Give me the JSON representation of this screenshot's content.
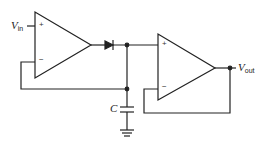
{
  "diagram": {
    "type": "circuit",
    "labels": {
      "vin_main": "V",
      "vin_sub": "in",
      "vout_main": "V",
      "vout_sub": "out",
      "capacitor": "C",
      "plus": "+",
      "minus": "−"
    },
    "components": [
      {
        "id": "opamp1",
        "kind": "op-amp"
      },
      {
        "id": "diode",
        "kind": "diode"
      },
      {
        "id": "cap",
        "kind": "capacitor",
        "label": "C"
      },
      {
        "id": "ground",
        "kind": "ground"
      },
      {
        "id": "opamp2",
        "kind": "op-amp"
      }
    ],
    "colors": {
      "line": "#222222",
      "background": "#ffffff"
    }
  }
}
